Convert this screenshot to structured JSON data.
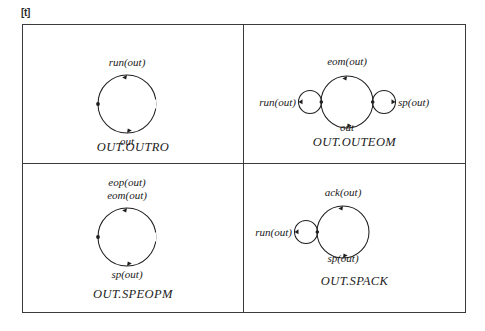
{
  "float_marker": "[t]",
  "figure": {
    "cells": [
      {
        "id": "out-outro",
        "caption": "OUT.OUTRO",
        "labels": {
          "top": "run(out)",
          "bottom": "out"
        }
      },
      {
        "id": "out-outeom",
        "caption": "OUT.OUTEOM",
        "labels": {
          "top": "eom(out)",
          "bottom": "out",
          "left": "run(out)",
          "right": "sp(out)"
        }
      },
      {
        "id": "out-speopm",
        "caption": "OUT.SPEOPM",
        "labels": {
          "top_first": "eop(out)",
          "top_second": "eom(out)",
          "bottom": "sp(out)"
        }
      },
      {
        "id": "out-spack",
        "caption": "OUT.SPACK",
        "labels": {
          "top": "ack(out)",
          "bottom": "sp(out)",
          "left": "run(out)"
        }
      }
    ]
  }
}
